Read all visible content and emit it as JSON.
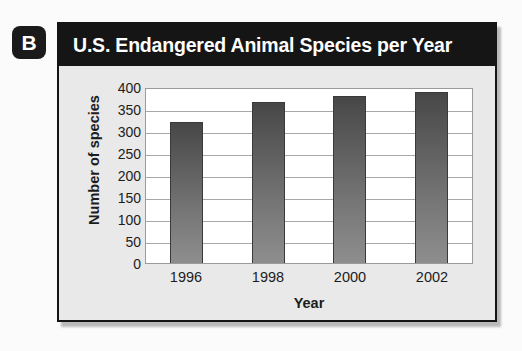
{
  "panel": {
    "badge_label": "B",
    "title": "U.S. Endangered Animal Species per Year"
  },
  "colors": {
    "panel_border": "#141414",
    "title_bar_bg": "#151515",
    "title_text": "#ffffff",
    "panel_bg": "#e9e9e9",
    "plot_bg": "#ffffff",
    "gridline": "#a8a8a8",
    "bar_top": "#474747",
    "bar_bottom": "#8e8e8e",
    "axis_text": "#1c1c1c"
  },
  "chart_data": {
    "type": "bar",
    "title": "U.S. Endangered Animal Species per Year",
    "xlabel": "Year",
    "ylabel": "Number of species",
    "categories": [
      "1996",
      "1998",
      "2000",
      "2002"
    ],
    "values": [
      320,
      365,
      380,
      388
    ],
    "ylim": [
      0,
      400
    ],
    "ytick_step": 50,
    "yticks": [
      "400",
      "350",
      "300",
      "250",
      "200",
      "150",
      "100",
      "50",
      "0"
    ],
    "ytick_values": [
      400,
      350,
      300,
      250,
      200,
      150,
      100,
      50,
      0
    ],
    "grid": "horizontal",
    "legend": "none",
    "annotations": []
  }
}
